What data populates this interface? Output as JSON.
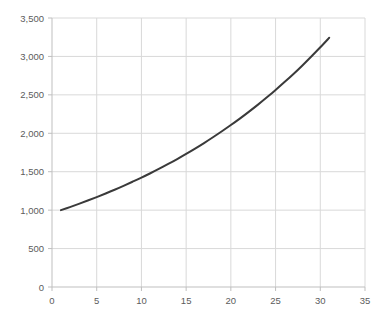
{
  "chart_data": {
    "type": "line",
    "title": "",
    "subtitle": "",
    "xlabel": "",
    "ylabel": "",
    "xlim": [
      0,
      35
    ],
    "ylim": [
      0,
      3500
    ],
    "grid": true,
    "legend": false,
    "legend_position": "none",
    "x_ticks": [
      0,
      5,
      10,
      15,
      20,
      25,
      30,
      35
    ],
    "x_tick_labels": [
      "0",
      "5",
      "10",
      "15",
      "20",
      "25",
      "30",
      "35"
    ],
    "y_ticks": [
      0,
      500,
      1000,
      1500,
      2000,
      2500,
      3000,
      3500
    ],
    "y_tick_labels": [
      "0",
      "500",
      "1,000",
      "1,500",
      "2,000",
      "2,500",
      "3,000",
      "3,500"
    ],
    "line_color": "#3a3a3a",
    "line_width": 2,
    "grid_color": "#d9d9d9",
    "axis_color": "#bfbfbf",
    "tick_label_color": "#5c5c5c",
    "series": [
      {
        "name": "series-1",
        "x": [
          1,
          2,
          3,
          4,
          5,
          6,
          7,
          8,
          9,
          10,
          11,
          12,
          13,
          14,
          15,
          16,
          17,
          18,
          19,
          20,
          21,
          22,
          23,
          24,
          25,
          26,
          27,
          28,
          29,
          30,
          31
        ],
        "values": [
          1000,
          1040,
          1082,
          1125,
          1170,
          1217,
          1265,
          1316,
          1369,
          1423,
          1480,
          1539,
          1601,
          1665,
          1732,
          1801,
          1873,
          1948,
          2026,
          2107,
          2191,
          2279,
          2370,
          2465,
          2563,
          2666,
          2772,
          2883,
          2999,
          3119,
          3243
        ]
      }
    ]
  },
  "plot_geometry": {
    "left": 52,
    "right": 365,
    "top": 18,
    "bottom": 287
  }
}
